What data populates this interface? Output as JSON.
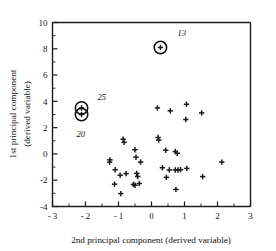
{
  "chart_data": {
    "type": "scatter",
    "title": "",
    "xlabel": "2nd principal component (derived variable)",
    "ylabel_line1": "1st principal component",
    "ylabel_line2": "(derived variable)",
    "xlim": [
      -3,
      3
    ],
    "ylim": [
      -4,
      10
    ],
    "xticks": [
      -3,
      -2,
      -1,
      0,
      1,
      2,
      3
    ],
    "xticklabels": [
      "- 3",
      "- 2",
      "- 1",
      "0",
      "1",
      "2",
      "3"
    ],
    "yticks": [
      -4,
      -2,
      0,
      2,
      4,
      6,
      8,
      10
    ],
    "yticklabels": [
      "-4",
      "-2",
      "0",
      "2",
      "4",
      "6",
      "8",
      "10"
    ],
    "x_minor_ticks": [
      -2.5,
      -1.5,
      -0.5,
      0.5,
      1.5,
      2.5
    ],
    "y_minor_ticks": [
      -3,
      -1,
      1,
      3,
      5,
      7,
      9
    ],
    "grid": false,
    "legend": "none",
    "marker": "plus",
    "marker_color": "#1b1b1b",
    "points": [
      {
        "x": 0.27,
        "y": 8.1
      },
      {
        "x": -2.12,
        "y": 3.5
      },
      {
        "x": -2.12,
        "y": 3.0
      },
      {
        "x": 0.18,
        "y": 3.5
      },
      {
        "x": 0.57,
        "y": 3.28
      },
      {
        "x": 1.06,
        "y": 3.78
      },
      {
        "x": 1.52,
        "y": 3.12
      },
      {
        "x": 1.04,
        "y": 2.62
      },
      {
        "x": -0.86,
        "y": 1.12
      },
      {
        "x": -0.83,
        "y": 0.88
      },
      {
        "x": 0.2,
        "y": 1.25
      },
      {
        "x": 0.22,
        "y": 1.05
      },
      {
        "x": -0.5,
        "y": 0.32
      },
      {
        "x": 0.43,
        "y": 0.28
      },
      {
        "x": 0.72,
        "y": 0.18
      },
      {
        "x": 0.78,
        "y": 0.05
      },
      {
        "x": -1.26,
        "y": -0.45
      },
      {
        "x": -1.27,
        "y": -0.62
      },
      {
        "x": -0.47,
        "y": -0.25
      },
      {
        "x": -0.33,
        "y": -0.62
      },
      {
        "x": 2.13,
        "y": -0.62
      },
      {
        "x": -1.1,
        "y": -1.2
      },
      {
        "x": -0.95,
        "y": -1.62
      },
      {
        "x": -0.77,
        "y": -1.5
      },
      {
        "x": -0.45,
        "y": -1.48
      },
      {
        "x": -0.42,
        "y": -1.72
      },
      {
        "x": 0.33,
        "y": -1.05
      },
      {
        "x": 0.54,
        "y": -1.22
      },
      {
        "x": 0.72,
        "y": -1.22
      },
      {
        "x": 0.8,
        "y": -1.22
      },
      {
        "x": 0.88,
        "y": -1.2
      },
      {
        "x": 1.07,
        "y": -1.1
      },
      {
        "x": 1.55,
        "y": -1.72
      },
      {
        "x": 0.45,
        "y": -1.78
      },
      {
        "x": -1.12,
        "y": -2.3
      },
      {
        "x": -0.55,
        "y": -2.32
      },
      {
        "x": -0.37,
        "y": -2.25
      },
      {
        "x": -0.5,
        "y": -2.38
      },
      {
        "x": 0.74,
        "y": -2.7
      },
      {
        "x": -0.93,
        "y": -3.02
      }
    ],
    "highlighted": [
      {
        "x": 0.27,
        "y": 8.1,
        "label": "13",
        "label_dx": 17,
        "label_dy": -11
      },
      {
        "x": -2.12,
        "y": 3.5,
        "label": "25",
        "label_dx": 16,
        "label_dy": -8
      },
      {
        "x": -2.12,
        "y": 3.0,
        "label": "20",
        "label_dx": -5,
        "label_dy": 22
      }
    ],
    "annotations": [
      "13",
      "25",
      "20"
    ]
  }
}
